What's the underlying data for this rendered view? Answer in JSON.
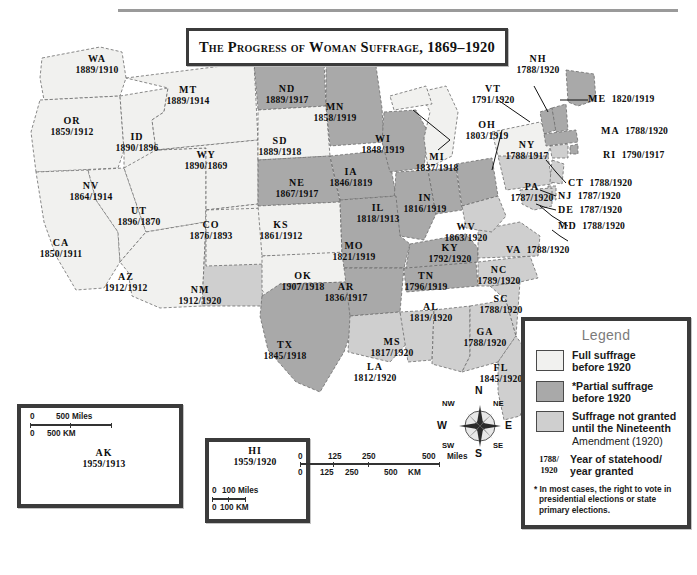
{
  "title": "The Progress of Woman Suffrage, 1869–1920",
  "colors": {
    "full_suffrage": "#f1f1ef",
    "partial_suffrage": "#a9a9a9",
    "not_granted": "#cfcfcf",
    "border": "#3b3b3b",
    "text": "#111111"
  },
  "legend": {
    "heading": "Legend",
    "items": [
      {
        "swatch": "full_suffrage",
        "line1": "Full suffrage",
        "line2": "before 1920"
      },
      {
        "swatch": "partial_suffrage",
        "line1": "*Partial suffrage",
        "line2": "before 1920"
      },
      {
        "swatch": "not_granted",
        "line1": "Suffrage not granted",
        "line2": "until the Nineteenth",
        "line3": "Amendment (1920)"
      }
    ],
    "year_key": {
      "top": "1788/",
      "bottom": "1920",
      "line1": "Year of statehood/",
      "line2": "year granted"
    },
    "footnote": "* In most cases, the right to vote in presidential elections or state primary elections."
  },
  "scale_main": {
    "miles_label": "Miles",
    "km_label": "KM",
    "miles_ticks": [
      "0",
      "125",
      "250",
      "500"
    ],
    "km_ticks": [
      "0",
      "125",
      "250",
      "500"
    ]
  },
  "scale_ak": {
    "miles_label": "500 Miles",
    "km_label": "500 KM",
    "zero": "0"
  },
  "scale_hi": {
    "miles_label": "100 Miles",
    "km_label": "100 KM",
    "zero": "0"
  },
  "compass": {
    "n": "N",
    "ne": "NE",
    "e": "E",
    "se": "SE",
    "s": "S",
    "sw": "SW",
    "w": "W",
    "nw": "NW"
  },
  "states": [
    {
      "abbr": "WA",
      "years": "1889/1910",
      "status": "full_suffrage"
    },
    {
      "abbr": "OR",
      "years": "1859/1912",
      "status": "full_suffrage"
    },
    {
      "abbr": "ID",
      "years": "1890/1896",
      "status": "full_suffrage"
    },
    {
      "abbr": "MT",
      "years": "1889/1914",
      "status": "full_suffrage"
    },
    {
      "abbr": "ND",
      "years": "1889/1917",
      "status": "partial_suffrage"
    },
    {
      "abbr": "MN",
      "years": "1858/1919",
      "status": "partial_suffrage"
    },
    {
      "abbr": "SD",
      "years": "1889/1918",
      "status": "full_suffrage"
    },
    {
      "abbr": "WY",
      "years": "1890/1869",
      "status": "full_suffrage"
    },
    {
      "abbr": "NV",
      "years": "1864/1914",
      "status": "full_suffrage"
    },
    {
      "abbr": "UT",
      "years": "1896/1870",
      "status": "full_suffrage"
    },
    {
      "abbr": "CO",
      "years": "1876/1893",
      "status": "full_suffrage"
    },
    {
      "abbr": "NE",
      "years": "1867/1917",
      "status": "partial_suffrage"
    },
    {
      "abbr": "KS",
      "years": "1861/1912",
      "status": "full_suffrage"
    },
    {
      "abbr": "CA",
      "years": "1850/1911",
      "status": "full_suffrage"
    },
    {
      "abbr": "AZ",
      "years": "1912/1912",
      "status": "full_suffrage"
    },
    {
      "abbr": "NM",
      "years": "1912/1920",
      "status": "not_granted"
    },
    {
      "abbr": "OK",
      "years": "1907/1918",
      "status": "full_suffrage"
    },
    {
      "abbr": "TX",
      "years": "1845/1918",
      "status": "partial_suffrage"
    },
    {
      "abbr": "IA",
      "years": "1846/1819",
      "status": "partial_suffrage"
    },
    {
      "abbr": "MO",
      "years": "1821/1919",
      "status": "partial_suffrage"
    },
    {
      "abbr": "AR",
      "years": "1836/1917",
      "status": "partial_suffrage"
    },
    {
      "abbr": "LA",
      "years": "1812/1920",
      "status": "not_granted"
    },
    {
      "abbr": "MS",
      "years": "1817/1920",
      "status": "not_granted"
    },
    {
      "abbr": "AL",
      "years": "1819/1920",
      "status": "not_granted"
    },
    {
      "abbr": "TN",
      "years": "1796/1919",
      "status": "partial_suffrage"
    },
    {
      "abbr": "KY",
      "years": "1792/1920",
      "status": "partial_suffrage"
    },
    {
      "abbr": "IL",
      "years": "1818/1913",
      "status": "partial_suffrage"
    },
    {
      "abbr": "IN",
      "years": "1816/1919",
      "status": "partial_suffrage"
    },
    {
      "abbr": "WI",
      "years": "1848/1919",
      "status": "partial_suffrage"
    },
    {
      "abbr": "MI",
      "years": "1837/1918",
      "status": "full_suffrage"
    },
    {
      "abbr": "OH",
      "years": "1803/1919",
      "status": "partial_suffrage"
    },
    {
      "abbr": "WV",
      "years": "1863/1920",
      "status": "not_granted"
    },
    {
      "abbr": "GA",
      "years": "1788/1920",
      "status": "not_granted"
    },
    {
      "abbr": "FL",
      "years": "1845/1920",
      "status": "not_granted"
    },
    {
      "abbr": "SC",
      "years": "1788/1920",
      "status": "not_granted"
    },
    {
      "abbr": "NC",
      "years": "1789/1920",
      "status": "not_granted"
    },
    {
      "abbr": "VA",
      "years": "1788/1920",
      "status": "not_granted"
    },
    {
      "abbr": "NY",
      "years": "1788/1917",
      "status": "full_suffrage"
    },
    {
      "abbr": "PA",
      "years": "1787/1920",
      "status": "not_granted"
    },
    {
      "abbr": "VT",
      "years": "1791/1920",
      "status": "partial_suffrage"
    },
    {
      "abbr": "NH",
      "years": "1788/1920",
      "status": "partial_suffrage"
    },
    {
      "abbr": "ME",
      "years": "1820/1919",
      "status": "partial_suffrage"
    },
    {
      "abbr": "MA",
      "years": "1788/1920",
      "status": "partial_suffrage"
    },
    {
      "abbr": "RI",
      "years": "1790/1917",
      "status": "partial_suffrage"
    },
    {
      "abbr": "CT",
      "years": "1788/1920",
      "status": "not_granted"
    },
    {
      "abbr": "NJ",
      "years": "1787/1920",
      "status": "not_granted"
    },
    {
      "abbr": "DE",
      "years": "1787/1920",
      "status": "not_granted"
    },
    {
      "abbr": "MD",
      "years": "1788/1920",
      "status": "not_granted"
    },
    {
      "abbr": "AK",
      "years": "1959/1913",
      "status": "full_suffrage"
    },
    {
      "abbr": "HI",
      "years": "1959/1920",
      "status": "not_granted"
    }
  ]
}
